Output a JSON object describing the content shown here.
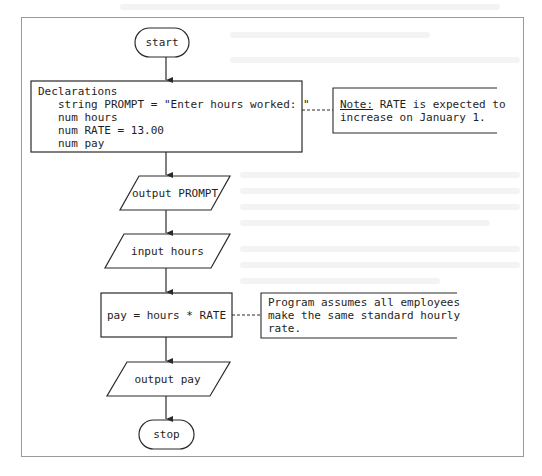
{
  "flowchart": {
    "start": {
      "label": "start"
    },
    "declarations": {
      "title": "Declarations",
      "lines": [
        "string PROMPT = \"Enter hours worked: \"",
        "num hours",
        "num RATE = 13.00",
        "num pay"
      ]
    },
    "note_rate": {
      "label": "Note:",
      "text_line1": " RATE is expected to",
      "text_line2": "increase on January 1."
    },
    "output_prompt": {
      "label": "output PROMPT"
    },
    "input_hours": {
      "label": "input hours"
    },
    "process_pay": {
      "label": "pay = hours * RATE"
    },
    "note_assumption": {
      "lines": [
        "Program assumes all employees",
        "make the same standard hourly",
        "rate."
      ]
    },
    "output_pay": {
      "label": "output pay"
    },
    "stop": {
      "label": "stop"
    }
  },
  "colors": {
    "stroke": "#2a2a2a",
    "frame": "#9a9a9a",
    "background": "#ffffff"
  }
}
